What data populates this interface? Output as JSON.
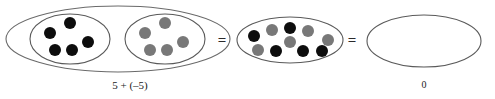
{
  "figure": {
    "title_text": "",
    "background": "#ffffff",
    "colors": {
      "positive_counter": "#0d0d0d",
      "negative_counter": "#787878",
      "ellipse_stroke": "#5a5a5a",
      "text": "#1a1a1a"
    },
    "expression_label": "5 + (–5)",
    "result_label": "0",
    "equals_signs": [
      "=",
      "="
    ],
    "groups": [
      {
        "name": "positive-group",
        "counter_color_key": "positive_counter",
        "count": 5,
        "cx": 70,
        "cy": 39,
        "rx": 40,
        "ry": 25,
        "dots": [
          {
            "x": 70,
            "y": 23,
            "r": 6
          },
          {
            "x": 50,
            "y": 33,
            "r": 6
          },
          {
            "x": 88,
            "y": 42,
            "r": 6
          },
          {
            "x": 55,
            "y": 50,
            "r": 6
          },
          {
            "x": 72,
            "y": 50,
            "r": 6
          }
        ]
      },
      {
        "name": "negative-group",
        "counter_color_key": "negative_counter",
        "count": 5,
        "cx": 165,
        "cy": 39,
        "rx": 40,
        "ry": 25,
        "dots": [
          {
            "x": 165,
            "y": 23,
            "r": 6
          },
          {
            "x": 145,
            "y": 33,
            "r": 6
          },
          {
            "x": 183,
            "y": 42,
            "r": 6
          },
          {
            "x": 150,
            "y": 50,
            "r": 6
          },
          {
            "x": 167,
            "y": 50,
            "r": 6
          }
        ]
      }
    ],
    "outer_group": {
      "name": "combined-outer-group",
      "cx": 118,
      "cy": 39,
      "rx": 112,
      "ry": 33
    },
    "middle_group": {
      "name": "combined-counters-group",
      "cx": 290,
      "cy": 40,
      "rx": 53,
      "ry": 23,
      "count": 10,
      "dots": [
        {
          "x": 254,
          "y": 36,
          "r": 6,
          "color_key": "positive_counter"
        },
        {
          "x": 272,
          "y": 30,
          "r": 6,
          "color_key": "negative_counter"
        },
        {
          "x": 290,
          "y": 28,
          "r": 6,
          "color_key": "positive_counter"
        },
        {
          "x": 308,
          "y": 31,
          "r": 6,
          "color_key": "negative_counter"
        },
        {
          "x": 290,
          "y": 42,
          "r": 6,
          "color_key": "negative_counter"
        },
        {
          "x": 328,
          "y": 40,
          "r": 6,
          "color_key": "negative_counter"
        },
        {
          "x": 258,
          "y": 50,
          "r": 6,
          "color_key": "negative_counter"
        },
        {
          "x": 276,
          "y": 51,
          "r": 6,
          "color_key": "positive_counter"
        },
        {
          "x": 303,
          "y": 51,
          "r": 6,
          "color_key": "positive_counter"
        },
        {
          "x": 322,
          "y": 51,
          "r": 6,
          "color_key": "positive_counter"
        }
      ]
    },
    "result_group": {
      "name": "empty-result-group",
      "cx": 424,
      "cy": 41,
      "rx": 57,
      "ry": 26,
      "count": 0
    },
    "equals_positions": [
      {
        "x": 222,
        "y": 45
      },
      {
        "x": 352,
        "y": 45
      }
    ],
    "expression_label_pos": {
      "x": 130,
      "y": 89
    },
    "result_label_pos": {
      "x": 424,
      "y": 88
    }
  }
}
